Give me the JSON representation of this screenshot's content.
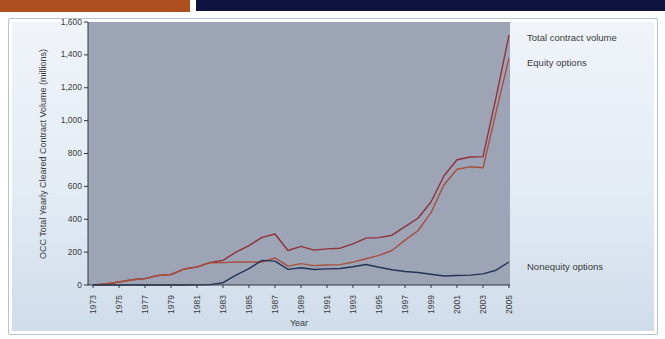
{
  "header": {
    "orange_bar_color": "#ad4f1f",
    "navy_bar_color": "#0e1340"
  },
  "panel": {
    "background_top": "#f0f4f9",
    "background_bottom": "#cfdcea",
    "border_color": "#b3c3d6"
  },
  "chart_data": {
    "type": "line",
    "title": "",
    "xlabel": "Year",
    "ylabel": "OCC Total Yearly Cleared Contract Volume (millions)",
    "ylim": [
      0,
      1600
    ],
    "ytick_step": 200,
    "ytick_labels": [
      "0",
      "200",
      "400",
      "600",
      "800",
      "1,000",
      "1,200",
      "1,400",
      "1,600"
    ],
    "xtick_labels": [
      "1973",
      "1975",
      "1977",
      "1979",
      "1981",
      "1983",
      "1985",
      "1987",
      "1989",
      "1991",
      "1993",
      "1995",
      "1997",
      "1999",
      "2001",
      "2003",
      "2005"
    ],
    "x": [
      1973,
      1974,
      1975,
      1976,
      1977,
      1978,
      1979,
      1980,
      1981,
      1982,
      1983,
      1984,
      1985,
      1986,
      1987,
      1988,
      1989,
      1990,
      1991,
      1992,
      1993,
      1994,
      1995,
      1996,
      1997,
      1998,
      1999,
      2000,
      2001,
      2002,
      2003,
      2004,
      2005
    ],
    "series": [
      {
        "name": "Total contract volume",
        "color": "#8e3338",
        "values": [
          1,
          6,
          18,
          32,
          39,
          58,
          64,
          97,
          110,
          137,
          150,
          200,
          240,
          290,
          310,
          210,
          235,
          212,
          220,
          224,
          250,
          285,
          288,
          303,
          355,
          406,
          505,
          665,
          762,
          779,
          781,
          1140,
          1520
        ]
      },
      {
        "name": "Equity options",
        "color": "#a94f3d",
        "values": [
          1,
          6,
          18,
          32,
          39,
          58,
          64,
          97,
          109,
          135,
          136,
          140,
          140,
          140,
          165,
          115,
          130,
          118,
          122,
          124,
          139,
          160,
          180,
          210,
          273,
          330,
          440,
          610,
          704,
          719,
          713,
          1050,
          1380
        ]
      },
      {
        "name": "Nonequity options",
        "color": "#233459",
        "values": [
          0,
          0,
          0,
          0,
          0,
          0,
          0,
          0,
          1,
          2,
          14,
          60,
          100,
          150,
          145,
          95,
          105,
          94,
          98,
          100,
          111,
          125,
          108,
          93,
          82,
          76,
          65,
          55,
          58,
          60,
          68,
          90,
          140
        ]
      }
    ],
    "legend_position": "right",
    "grid": false,
    "plot_bg": "#9ca4b5",
    "axis_color": "#33363f"
  }
}
